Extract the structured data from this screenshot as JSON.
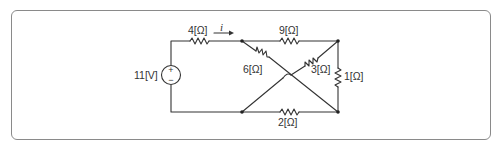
{
  "circuit": {
    "source": {
      "label": "11[V]",
      "type": "dc-voltage-source",
      "plus": "+",
      "minus": "−"
    },
    "current": {
      "label": "i"
    },
    "resistors": [
      {
        "id": "r4",
        "label": "4[Ω]"
      },
      {
        "id": "r9",
        "label": "9[Ω]"
      },
      {
        "id": "r6",
        "label": "6[Ω]"
      },
      {
        "id": "r3",
        "label": "3[Ω]"
      },
      {
        "id": "r1",
        "label": "1[Ω]"
      },
      {
        "id": "r2",
        "label": "2[Ω]"
      }
    ]
  },
  "colors": {
    "wire": "#333333",
    "frame": "#8a8a8a",
    "text": "#333333"
  }
}
